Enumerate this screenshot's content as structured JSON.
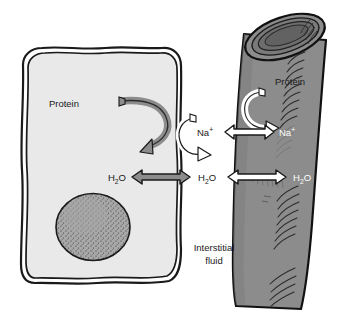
{
  "figure": {
    "background_color": "#ffffff"
  },
  "cell": {
    "name": "body cell",
    "fill_color": "#e9e9e9",
    "membrane_color": "#1a1a1a",
    "nucleus": {
      "name": "nucleus",
      "fill_color": "#a8a8a8",
      "stipple_color": "#2b2b2b"
    },
    "protein_label": "Protein",
    "protein_arrow_color": "#8c8c8c"
  },
  "interstitial": {
    "label_line1": "Interstitial",
    "label_line2": "fluid",
    "na_label": "Na",
    "na_charge": "+",
    "h2o_label_part1": "H",
    "h2o_sub": "2",
    "h2o_label_part2": "O",
    "sodium_arrow_color": "#ffffff"
  },
  "capillary": {
    "name": "capillary vessel",
    "fill_color": "#8c8c8c",
    "outline_color": "#111111",
    "hatch_color": "#2a2a2a",
    "protein_label": "Protein",
    "protein_arrow_color": "#ffffff",
    "na_label": "Na",
    "na_charge": "+",
    "h2o_label_part1": "H",
    "h2o_sub": "2",
    "h2o_label_part2": "O"
  },
  "arrows": {
    "cell_h2o": {
      "name": "cell-to-interstitial water exchange",
      "fill_color": "#8c8c8c",
      "direction": "bidirectional"
    },
    "na_exchange": {
      "name": "interstitial-to-capillary sodium exchange",
      "fill_color": "#ffffff",
      "direction": "bidirectional"
    },
    "capillary_h2o": {
      "name": "interstitial-to-capillary water exchange",
      "fill_color": "#ffffff",
      "direction": "bidirectional"
    }
  },
  "labels": {
    "cell_protein": "Protein",
    "interstitial_na": "Na",
    "interstitial_h2o": "H2O",
    "capillary_protein": "Protein",
    "capillary_na": "Na",
    "capillary_h2o": "H2O",
    "cell_h2o": "H2O",
    "interstitial_fluid": "Interstitial fluid"
  }
}
